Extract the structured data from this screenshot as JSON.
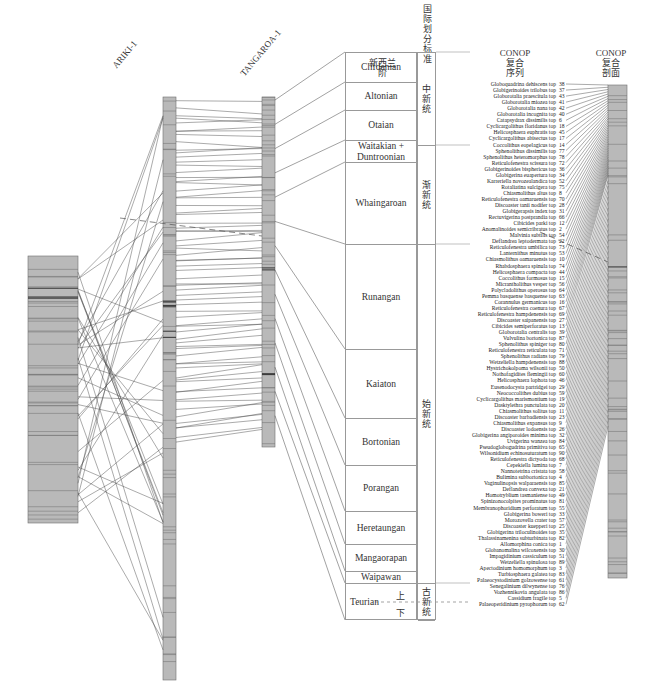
{
  "wells": [
    {
      "name": "ARIKI-1",
      "label_x": 118,
      "label_y": 70
    },
    {
      "name": "TANGAROA-1",
      "label_x": 202,
      "label_y": 78
    }
  ],
  "headers": {
    "nz_stage": "新西兰\n阶",
    "intl_division": "国际划分标准",
    "conop_sequence": "CONOP\n复合\n序列",
    "conop_section": "CONOP\n复合\n剖面"
  },
  "stages": [
    {
      "name": "Clifdenian",
      "top": 52,
      "height": 30
    },
    {
      "name": "Altonian",
      "top": 82,
      "height": 28
    },
    {
      "name": "Otaian",
      "top": 110,
      "height": 30
    },
    {
      "name": "Waitakian +\nDuntroonian",
      "top": 140,
      "height": 22
    },
    {
      "name": "Whaingaroan",
      "top": 162,
      "height": 82
    },
    {
      "name": "Runangan",
      "top": 244,
      "height": 105
    },
    {
      "name": "Kaiaton",
      "top": 349,
      "height": 69
    },
    {
      "name": "Bortonian",
      "top": 418,
      "height": 47
    },
    {
      "name": "Porangan",
      "top": 465,
      "height": 46
    },
    {
      "name": "Heretaungan",
      "top": 511,
      "height": 33
    },
    {
      "name": "Mangaorapan",
      "top": 544,
      "height": 27
    },
    {
      "name": "Waipawan",
      "top": 571,
      "height": 12
    },
    {
      "name": "Teurian",
      "top": 583,
      "height": 37
    }
  ],
  "teurian_subdivisions": {
    "upper": "上",
    "lower": "下"
  },
  "series": [
    {
      "name": "中新统",
      "top": 52,
      "height": 93
    },
    {
      "name": "渐新统",
      "top": 145,
      "height": 99
    },
    {
      "name": "始新统",
      "top": 244,
      "height": 339
    },
    {
      "name": "古新统",
      "top": 583,
      "height": 37
    }
  ],
  "conop_taxa": [
    {
      "name": "Globoquadrina dehiscens top",
      "id": 38
    },
    {
      "name": "Globigerinoides trilobus top",
      "id": 37
    },
    {
      "name": "Globorotalia praescitula top",
      "id": 43
    },
    {
      "name": "Globorotalia miozea top",
      "id": 41
    },
    {
      "name": "Globorotalia nana top",
      "id": 42
    },
    {
      "name": "Globorotalia incognita top",
      "id": 40
    },
    {
      "name": "Catapsydrax dissimilis top",
      "id": 6
    },
    {
      "name": "Cyclicargolithus floridanus top",
      "id": 18
    },
    {
      "name": "Helicosphaera euphratis top",
      "id": 45
    },
    {
      "name": "Cyclicargolithus abisectus top",
      "id": 17
    },
    {
      "name": "Coccolithus eopelagicus top",
      "id": 14
    },
    {
      "name": "Sphenolithus dissimilis top",
      "id": 77
    },
    {
      "name": "Sphenolithus heteromorphus top",
      "id": 78
    },
    {
      "name": "Reticulofenestra scissura top",
      "id": 72
    },
    {
      "name": "Globigerinoides bisphericus top",
      "id": 36
    },
    {
      "name": "Globigerina euapertura top",
      "id": 34
    },
    {
      "name": "Karreriella novozealandica top",
      "id": 52
    },
    {
      "name": "Rotaliatina sulcigera top",
      "id": 75
    },
    {
      "name": "Chiasmolithus altus top",
      "id": 8
    },
    {
      "name": "Reticulofenestra oamaruensis top",
      "id": 70
    },
    {
      "name": "Discoaster tanii nodifer top",
      "id": 28
    },
    {
      "name": "Globigerapsis index top",
      "id": 31
    },
    {
      "name": "Rectuvigerina postprandia top",
      "id": 66
    },
    {
      "name": "Cibicides parki top",
      "id": 12
    },
    {
      "name": "Anomalinoides semicribratus top",
      "id": 2
    },
    {
      "name": "Malvinia subtilis top",
      "id": 54
    },
    {
      "name": "Deflandrea leptodermata top",
      "id": 22
    },
    {
      "name": "Reticulofenestra umbilica top",
      "id": 73
    },
    {
      "name": "Lanternithus minutus top",
      "id": 53
    },
    {
      "name": "Chiasmolithus oamaruensis top",
      "id": 10
    },
    {
      "name": "Rhabdosphaera spinula top",
      "id": 74
    },
    {
      "name": "Helicosphaera compacta top",
      "id": 44
    },
    {
      "name": "Coccolithus formosus top",
      "id": 15
    },
    {
      "name": "Micrantholithus vesper top",
      "id": 56
    },
    {
      "name": "Polycladolithus operosus top",
      "id": 64
    },
    {
      "name": "Pemma basquense basquense top",
      "id": 63
    },
    {
      "name": "Corannulus germanicus top",
      "id": 16
    },
    {
      "name": "Reticulofenestra coenura top",
      "id": 67
    },
    {
      "name": "Reticulofenestra hampdenensis top",
      "id": 69
    },
    {
      "name": "Discoaster saipanensis top",
      "id": 27
    },
    {
      "name": "Cibicides semiperforatus top",
      "id": 13
    },
    {
      "name": "Globorotalia centralis top",
      "id": 39
    },
    {
      "name": "Vulvulina bortonica top",
      "id": 87
    },
    {
      "name": "Sphenolithus spiniger top",
      "id": 80
    },
    {
      "name": "Reticulofenestra reticulata top",
      "id": 71
    },
    {
      "name": "Sphenolithus radians top",
      "id": 79
    },
    {
      "name": "Wetzeliella hampdenensis top",
      "id": 88
    },
    {
      "name": "Hystrichokolpoma wilsonii top",
      "id": 50
    },
    {
      "name": "Nothofagidites flemingii top",
      "id": 60
    },
    {
      "name": "Helicosphaera lophota top",
      "id": 46
    },
    {
      "name": "Eusenodocysta partridgei top",
      "id": 29
    },
    {
      "name": "Neococcolithes dubius top",
      "id": 59
    },
    {
      "name": "Cyclicargolithus marismontium top",
      "id": 19
    },
    {
      "name": "Dasktylethra punctulata top",
      "id": 20
    },
    {
      "name": "Chiasmolithus solitus top",
      "id": 11
    },
    {
      "name": "Discoaster barbadiensis top",
      "id": 23
    },
    {
      "name": "Chiasmolithus expansus top",
      "id": 9
    },
    {
      "name": "Discoaster lodoensis top",
      "id": 26
    },
    {
      "name": "Globigerina angiporoides minima top",
      "id": 32
    },
    {
      "name": "Uvigerina wanzea top",
      "id": 84
    },
    {
      "name": "Pseudoglobogudrina primitiva top",
      "id": 65
    },
    {
      "name": "Wilsonidium echinosuturatum top",
      "id": 90
    },
    {
      "name": "Reticulofenestra dictyoda top",
      "id": 68
    },
    {
      "name": "Cepekiella lumina top",
      "id": 7
    },
    {
      "name": "Nannotetrina cristata top",
      "id": 58
    },
    {
      "name": "Bulimina subbortonica top",
      "id": 4
    },
    {
      "name": "Vaginulinopsis walparaensis top",
      "id": 85
    },
    {
      "name": "Deflandrea convexa top",
      "id": 21
    },
    {
      "name": "Homotryblium tasmaniense top",
      "id": 49
    },
    {
      "name": "Spinizonocolpites prominatus top",
      "id": 81
    },
    {
      "name": "Membranophoridium perforatum top",
      "id": 55
    },
    {
      "name": "Globigerina boweri top",
      "id": 33
    },
    {
      "name": "Morozovella crater top",
      "id": 57
    },
    {
      "name": "Discoaster kuepperi top",
      "id": 25
    },
    {
      "name": "Globigerina triloculinoides top",
      "id": 35
    },
    {
      "name": "Thalassinamenina subturbinata top",
      "id": 82
    },
    {
      "name": "Allomorphina conica top",
      "id": 1
    },
    {
      "name": "Globanomalina wilcoxensis top",
      "id": 30
    },
    {
      "name": "Impagidinium cassiculum top",
      "id": 51
    },
    {
      "name": "Wetzeliella spinulosa top",
      "id": 89
    },
    {
      "name": "Apectodinium homomorphum top",
      "id": 3
    },
    {
      "name": "Turbiosphaera galatea top",
      "id": 83
    },
    {
      "name": "Palaeocystodinium golzowense top",
      "id": 61
    },
    {
      "name": "Senegalinium dilwynense top",
      "id": 76
    },
    {
      "name": "Vozhennikovia angulata top",
      "id": 86
    },
    {
      "name": "Cassidium fragile top",
      "id": 5
    },
    {
      "name": "Palaeoperidinium pyrophorum top",
      "id": 62
    }
  ],
  "colors": {
    "column_fill": "#b9b9b9",
    "column_line": "#6f6f6f",
    "correlation_line": "#444444",
    "box_border": "#999999"
  }
}
